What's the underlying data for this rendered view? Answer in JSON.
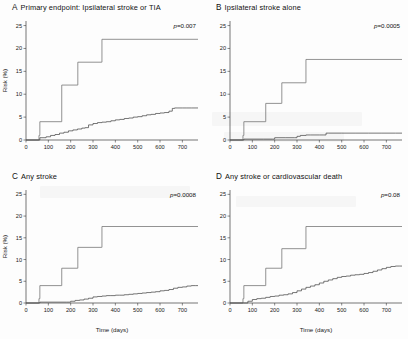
{
  "figure": {
    "axis": {
      "ylabel": "Risk (%)",
      "xlabel": "Time (days)",
      "yticks": [
        "0",
        "5",
        "10",
        "15",
        "20",
        "25"
      ],
      "xticks": [
        "0",
        "100",
        "200",
        "300",
        "400",
        "500",
        "600",
        "700"
      ],
      "ylim": [
        0,
        26
      ],
      "xlim": [
        0,
        770
      ]
    }
  },
  "chart_data": [
    {
      "type": "line",
      "panel": "A",
      "letter": "A",
      "title": "Primary endpoint: Ipsilateral stroke or TIA",
      "pvalue_label": "p=0.007",
      "pvalue": 0.007,
      "xlabel": "",
      "ylabel": "Risk (%)",
      "xlim": [
        0,
        770
      ],
      "ylim": [
        0,
        26
      ],
      "grid": false,
      "legend": "none",
      "series": [
        {
          "name": "medical-therapy-group",
          "style": "step",
          "x": [
            0,
            55,
            58,
            60,
            62,
            158,
            160,
            230,
            232,
            338,
            340,
            770
          ],
          "y": [
            0,
            0,
            1.0,
            1.0,
            4.0,
            4.0,
            12.0,
            12.0,
            17.0,
            17.0,
            22.0,
            22.0
          ]
        },
        {
          "name": "intervention-group",
          "style": "step",
          "x": [
            0,
            60,
            62,
            90,
            110,
            130,
            150,
            170,
            190,
            210,
            230,
            250,
            265,
            280,
            300,
            320,
            340,
            360,
            380,
            400,
            420,
            440,
            460,
            480,
            500,
            520,
            540,
            560,
            580,
            600,
            620,
            640,
            655,
            665,
            680,
            700,
            720,
            740,
            770
          ],
          "y": [
            0,
            0,
            0.5,
            0.7,
            1.0,
            1.2,
            1.5,
            1.7,
            2.0,
            2.2,
            2.4,
            2.6,
            2.7,
            3.3,
            3.6,
            3.8,
            3.9,
            4.0,
            4.2,
            4.4,
            4.5,
            4.7,
            4.8,
            5.0,
            5.1,
            5.3,
            5.5,
            5.6,
            5.8,
            5.9,
            6.0,
            6.3,
            6.9,
            7.0,
            7.0,
            7.0,
            7.0,
            7.0,
            7.0
          ]
        }
      ]
    },
    {
      "type": "line",
      "panel": "B",
      "letter": "B",
      "title": "Ipsilateral stroke alone",
      "pvalue_label": "p=0.0005",
      "pvalue": 0.0005,
      "xlabel": "",
      "ylabel": "Risk (%)",
      "xlim": [
        0,
        770
      ],
      "ylim": [
        0,
        26
      ],
      "grid": false,
      "legend": "none",
      "series": [
        {
          "name": "medical-therapy-group",
          "style": "step",
          "x": [
            0,
            55,
            58,
            60,
            62,
            158,
            160,
            230,
            232,
            338,
            340,
            770
          ],
          "y": [
            0,
            0,
            1.0,
            1.0,
            4.0,
            4.0,
            8.0,
            8.0,
            12.5,
            12.5,
            17.6,
            17.6
          ]
        },
        {
          "name": "intervention-group",
          "style": "step",
          "x": [
            0,
            60,
            62,
            150,
            190,
            200,
            215,
            250,
            290,
            300,
            315,
            340,
            360,
            380,
            400,
            420,
            430,
            440,
            500,
            560,
            620,
            680,
            740,
            770
          ],
          "y": [
            0,
            0,
            0.2,
            0.2,
            0.2,
            0.5,
            0.5,
            0.5,
            0.5,
            0.8,
            1.0,
            1.1,
            1.1,
            1.1,
            1.1,
            1.1,
            1.5,
            1.5,
            1.5,
            1.5,
            1.5,
            1.5,
            1.5,
            1.5
          ]
        }
      ]
    },
    {
      "type": "line",
      "panel": "C",
      "letter": "C",
      "title": "Any stroke",
      "pvalue_label": "p=0.0008",
      "pvalue": 0.0008,
      "xlabel": "Time (days)",
      "ylabel": "Risk (%)",
      "xlim": [
        0,
        770
      ],
      "ylim": [
        0,
        26
      ],
      "grid": false,
      "legend": "none",
      "series": [
        {
          "name": "medical-therapy-group",
          "style": "step",
          "x": [
            0,
            55,
            58,
            60,
            62,
            158,
            160,
            230,
            232,
            338,
            340,
            770
          ],
          "y": [
            0,
            0,
            1.0,
            1.0,
            4.0,
            4.0,
            8.0,
            8.0,
            12.8,
            12.8,
            17.6,
            17.6
          ]
        },
        {
          "name": "intervention-group",
          "style": "step",
          "x": [
            0,
            60,
            62,
            180,
            200,
            220,
            240,
            260,
            280,
            300,
            320,
            340,
            360,
            380,
            400,
            420,
            440,
            460,
            480,
            500,
            520,
            540,
            560,
            580,
            600,
            620,
            640,
            660,
            680,
            700,
            720,
            740,
            760,
            770
          ],
          "y": [
            0,
            0,
            0.2,
            0.2,
            0.4,
            0.6,
            0.7,
            0.9,
            1.1,
            1.4,
            1.5,
            1.6,
            1.7,
            1.7,
            1.8,
            1.8,
            1.9,
            2.0,
            2.1,
            2.2,
            2.3,
            2.4,
            2.5,
            2.6,
            2.8,
            2.9,
            3.1,
            3.4,
            3.6,
            3.7,
            3.9,
            4.0,
            4.0,
            4.0
          ]
        }
      ]
    },
    {
      "type": "line",
      "panel": "D",
      "letter": "D",
      "title": "Any stroke or cardiovascular death",
      "pvalue_label": "p=0.08",
      "pvalue": 0.08,
      "xlabel": "Time (days)",
      "ylabel": "Risk (%)",
      "xlim": [
        0,
        770
      ],
      "ylim": [
        0,
        26
      ],
      "grid": false,
      "legend": "none",
      "series": [
        {
          "name": "medical-therapy-group",
          "style": "step",
          "x": [
            0,
            55,
            58,
            60,
            62,
            158,
            160,
            230,
            232,
            338,
            340,
            770
          ],
          "y": [
            0,
            0,
            1.0,
            1.0,
            4.0,
            4.0,
            8.0,
            8.0,
            12.5,
            12.5,
            17.6,
            17.6
          ]
        },
        {
          "name": "intervention-group",
          "style": "step",
          "x": [
            0,
            60,
            80,
            100,
            120,
            140,
            160,
            180,
            200,
            220,
            240,
            260,
            280,
            300,
            320,
            340,
            360,
            380,
            400,
            420,
            440,
            460,
            480,
            500,
            520,
            540,
            560,
            580,
            600,
            620,
            640,
            660,
            680,
            700,
            720,
            740,
            760,
            770
          ],
          "y": [
            0,
            0,
            0.4,
            0.8,
            1.0,
            1.1,
            1.3,
            1.5,
            1.6,
            1.8,
            1.9,
            2.1,
            2.4,
            2.8,
            3.2,
            3.6,
            3.9,
            4.2,
            4.6,
            5.0,
            5.3,
            5.6,
            5.9,
            6.1,
            6.2,
            6.4,
            6.5,
            6.6,
            6.8,
            7.0,
            7.3,
            7.6,
            7.9,
            8.2,
            8.4,
            8.5,
            8.5,
            8.5
          ]
        }
      ]
    }
  ]
}
